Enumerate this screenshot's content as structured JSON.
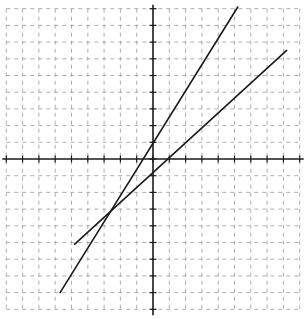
{
  "graph": {
    "title": "",
    "x_range": [
      -9,
      9
    ],
    "y_range": [
      -9,
      9
    ],
    "grid": true,
    "grid_style": "dashed",
    "grid_color": "#9a9a9a",
    "axis_color": "#1a1a1a",
    "line_color": "#1a1a1a",
    "origin_px": [
      153,
      159
    ],
    "unit_px": [
      16.3,
      16.7
    ]
  },
  "chart_data": {
    "type": "line",
    "title": "",
    "xlabel": "",
    "ylabel": "",
    "xlim": [
      -9,
      9
    ],
    "ylim": [
      -9,
      9
    ],
    "grid": true,
    "tick_step": 1,
    "tick_labels": false,
    "series": [
      {
        "name": "steep line",
        "approx_equation": "y = 1.6x + 1",
        "y_intercept": 1,
        "x_intercept": -0.5,
        "points": [
          [
            -5.7,
            -8.0
          ],
          [
            5.2,
            9.1
          ]
        ]
      },
      {
        "name": "shallow line",
        "approx_equation": "y = 0.9x - 1",
        "y_intercept": -1,
        "x_intercept": 1,
        "points": [
          [
            -4.8,
            -5.1
          ],
          [
            8.2,
            6.5
          ]
        ]
      }
    ],
    "intersection": [
      -2.6,
      -3.0
    ]
  }
}
